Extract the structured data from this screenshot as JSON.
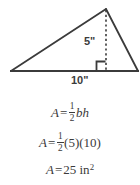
{
  "figure": {
    "shape_name": "triangle",
    "height_label": "5\"",
    "base_label": "10\"",
    "stroke_color": "#3b3b3b",
    "background_color": "#ffffff",
    "right_angle_marker": true,
    "height_line_style": "dashed",
    "geometry": {
      "left_vertex": [
        11,
        71
      ],
      "apex": [
        106,
        9
      ],
      "right_vertex": [
        138,
        71
      ],
      "foot_of_height": [
        106,
        71
      ]
    }
  },
  "equations": {
    "line1": {
      "lhs": "A",
      "equals": "=",
      "fraction_numerator": "1",
      "fraction_denominator": "2",
      "rhs_var_b": "b",
      "rhs_var_h": "h",
      "plain": "A = 1/2 bh"
    },
    "line2": {
      "lhs": "A",
      "equals": "=",
      "fraction_numerator": "1",
      "fraction_denominator": "2",
      "factor_one": "(5)",
      "factor_two": "(10)",
      "plain": "A = 1/2 (5)(10)"
    },
    "line3": {
      "lhs": "A",
      "equals": "=",
      "value": "25",
      "unit": "in",
      "exponent": "2",
      "plain": "A = 25 in^2"
    }
  }
}
